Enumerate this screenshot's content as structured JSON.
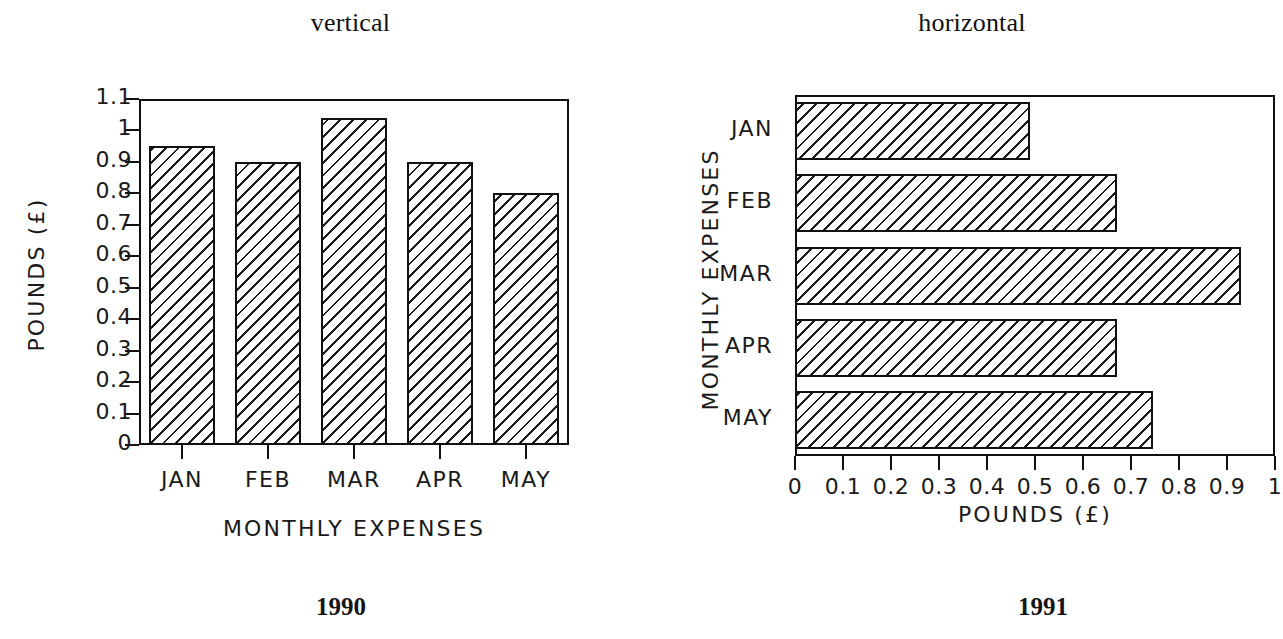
{
  "figure": {
    "background_color": "#ffffff",
    "ink_color": "#111111"
  },
  "panels": {
    "vertical": {
      "title": "vertical",
      "caption": "1990",
      "xlabel": "MONTHLY EXPENSES",
      "ylabel": "POUNDS (£)",
      "categories": [
        "JAN",
        "FEB",
        "MAR",
        "APR",
        "MAY"
      ],
      "ytick_labels": [
        "0",
        "0.1",
        "0.2",
        "0.3",
        "0.4",
        "0.5",
        "0.6",
        "0.7",
        "0.8",
        "0.9",
        "1",
        "1.1"
      ]
    },
    "horizontal": {
      "title": "horizontal",
      "caption": "1991",
      "xlabel": "POUNDS (£)",
      "ylabel": "MONTHLY EXPENSES",
      "categories": [
        "JAN",
        "FEB",
        "MAR",
        "APR",
        "MAY"
      ],
      "xtick_labels": [
        "0",
        "0.1",
        "0.2",
        "0.3",
        "0.4",
        "0.5",
        "0.6",
        "0.7",
        "0.8",
        "0.9",
        "1"
      ]
    }
  },
  "chart_data": [
    {
      "type": "bar",
      "orientation": "vertical",
      "title": "vertical",
      "caption": "1990",
      "categories": [
        "JAN",
        "FEB",
        "MAR",
        "APR",
        "MAY"
      ],
      "values": [
        0.95,
        0.9,
        1.04,
        0.9,
        0.8
      ],
      "xlabel": "MONTHLY EXPENSES",
      "ylabel": "POUNDS (£)",
      "ylim": [
        0,
        1.1
      ],
      "ytick_values": [
        0,
        0.1,
        0.2,
        0.3,
        0.4,
        0.5,
        0.6,
        0.7,
        0.8,
        0.9,
        1,
        1.1
      ],
      "ytick_labels": [
        "0",
        "0.1",
        "0.2",
        "0.3",
        "0.4",
        "0.5",
        "0.6",
        "0.7",
        "0.8",
        "0.9",
        "1",
        "1.1"
      ],
      "grid": false,
      "legend": false,
      "bar_fill": "diagonal-hatch"
    },
    {
      "type": "bar",
      "orientation": "horizontal",
      "title": "horizontal",
      "caption": "1991",
      "categories": [
        "JAN",
        "FEB",
        "MAR",
        "APR",
        "MAY"
      ],
      "values": [
        0.49,
        0.67,
        0.93,
        0.67,
        0.745
      ],
      "xlabel": "POUNDS (£)",
      "ylabel": "MONTHLY EXPENSES",
      "xlim": [
        0,
        1
      ],
      "xtick_values": [
        0,
        0.1,
        0.2,
        0.3,
        0.4,
        0.5,
        0.6,
        0.7,
        0.8,
        0.9,
        1
      ],
      "xtick_labels": [
        "0",
        "0.1",
        "0.2",
        "0.3",
        "0.4",
        "0.5",
        "0.6",
        "0.7",
        "0.8",
        "0.9",
        "1"
      ],
      "grid": false,
      "legend": false,
      "bar_fill": "diagonal-hatch"
    }
  ]
}
